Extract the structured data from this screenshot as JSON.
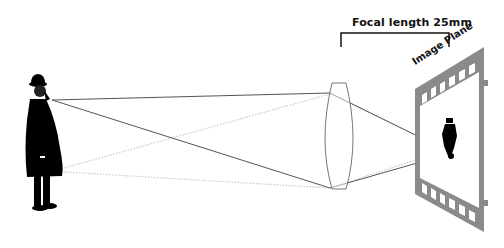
{
  "diagram": {
    "labels": {
      "focal_length": "Focal length 25mm",
      "image_plane": "Image Plane"
    },
    "elements": {
      "subject": "man-in-bowler-hat",
      "lens": "biconvex-lens",
      "image_plane": "film-strip",
      "image": "inverted-man"
    },
    "colors": {
      "background": "#ffffff",
      "solid_ray": "#555555",
      "dotted_ray": "#c8c8c8",
      "lens_outline": "#777777",
      "film": "#8a8a8a",
      "figure": "#000000",
      "text": "#111111"
    }
  }
}
